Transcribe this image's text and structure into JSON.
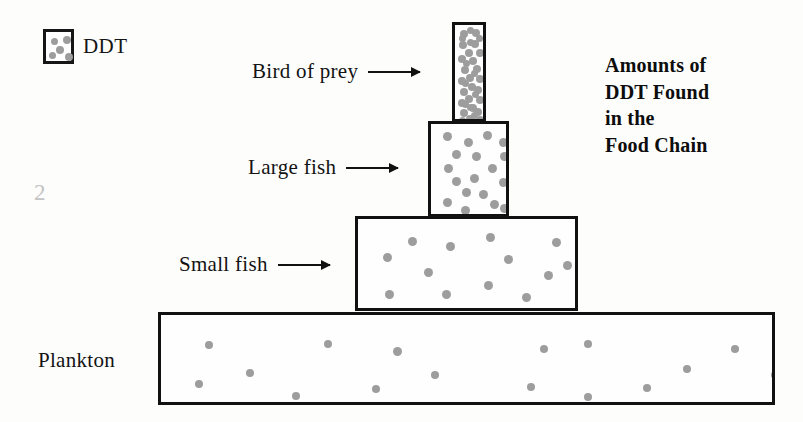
{
  "page": {
    "number": "2",
    "background_color": "#fdfdfc",
    "ink_color": "#111111",
    "dot_color": "#9d9d9d",
    "page_number_color": "#c3c3c3"
  },
  "legend": {
    "swatch_icon": "ddt-dots-swatch",
    "label": "DDT",
    "swatch_dots": [
      {
        "x": 5,
        "y": 6,
        "size": "sm"
      },
      {
        "x": 17,
        "y": 4,
        "size": "md"
      },
      {
        "x": 10,
        "y": 14,
        "size": "md"
      },
      {
        "x": 3,
        "y": 20,
        "size": "sm"
      },
      {
        "x": 19,
        "y": 21,
        "size": "md"
      }
    ]
  },
  "title": {
    "lines": [
      "Amounts of",
      "DDT Found",
      "in the",
      "Food Chain"
    ]
  },
  "chart_data": {
    "type": "bar",
    "xlabel": "",
    "ylabel": "",
    "legend": [
      {
        "name": "DDT",
        "symbol": "dot"
      }
    ],
    "orientation": "stacked-pyramid",
    "categories": [
      "Plankton",
      "Small fish",
      "Large fish",
      "Bird of prey"
    ],
    "values": [
      16,
      13,
      18,
      36
    ],
    "value_meaning": "number of DDT dots drawn inside each level's rectangle",
    "levels": [
      {
        "name": "Bird of prey",
        "label": "Bird of prey",
        "has_arrow": true,
        "rect": {
          "x": 452,
          "y": 22,
          "w": 34,
          "h": 100
        },
        "dot_count": 36,
        "ddt_density": "very high",
        "dots": [
          {
            "x": 5,
            "y": 5,
            "size": "md"
          },
          {
            "x": 17,
            "y": 4,
            "size": "md"
          },
          {
            "x": 4,
            "y": 16,
            "size": "md"
          },
          {
            "x": 16,
            "y": 15,
            "size": "md"
          },
          {
            "x": 10,
            "y": 24,
            "size": "md"
          },
          {
            "x": 21,
            "y": 24,
            "size": "md"
          },
          {
            "x": 3,
            "y": 30,
            "size": "md"
          },
          {
            "x": 14,
            "y": 32,
            "size": "md"
          },
          {
            "x": 6,
            "y": 41,
            "size": "md"
          },
          {
            "x": 18,
            "y": 40,
            "size": "md"
          },
          {
            "x": 11,
            "y": 49,
            "size": "md"
          },
          {
            "x": 21,
            "y": 50,
            "size": "md"
          },
          {
            "x": 3,
            "y": 52,
            "size": "md"
          },
          {
            "x": 13,
            "y": 58,
            "size": "md"
          },
          {
            "x": 5,
            "y": 63,
            "size": "md"
          },
          {
            "x": 19,
            "y": 61,
            "size": "md"
          },
          {
            "x": 10,
            "y": 70,
            "size": "md"
          },
          {
            "x": 21,
            "y": 71,
            "size": "md"
          },
          {
            "x": 3,
            "y": 74,
            "size": "md"
          },
          {
            "x": 14,
            "y": 79,
            "size": "md"
          },
          {
            "x": 5,
            "y": 84,
            "size": "md"
          },
          {
            "x": 19,
            "y": 83,
            "size": "md"
          },
          {
            "x": 11,
            "y": 90,
            "size": "md"
          },
          {
            "x": 21,
            "y": 91,
            "size": "md"
          },
          {
            "x": 4,
            "y": 10,
            "size": "sm"
          },
          {
            "x": 21,
            "y": 10,
            "size": "sm"
          },
          {
            "x": 12,
            "y": 14,
            "size": "sm"
          },
          {
            "x": 8,
            "y": 35,
            "size": "sm"
          },
          {
            "x": 16,
            "y": 45,
            "size": "sm"
          },
          {
            "x": 7,
            "y": 55,
            "size": "sm"
          },
          {
            "x": 17,
            "y": 66,
            "size": "sm"
          },
          {
            "x": 7,
            "y": 76,
            "size": "sm"
          },
          {
            "x": 16,
            "y": 87,
            "size": "sm"
          },
          {
            "x": 4,
            "y": 92,
            "size": "sm"
          },
          {
            "x": 12,
            "y": 79,
            "size": "sm"
          },
          {
            "x": 12,
            "y": 2,
            "size": "sm"
          }
        ]
      },
      {
        "name": "Large fish",
        "label": "Large fish",
        "has_arrow": true,
        "rect": {
          "x": 428,
          "y": 121,
          "w": 81,
          "h": 96
        },
        "dot_count": 18,
        "ddt_density": "high",
        "dots": [
          {
            "x": 12,
            "y": 8,
            "size": "lg"
          },
          {
            "x": 33,
            "y": 14,
            "size": "lg"
          },
          {
            "x": 52,
            "y": 7,
            "size": "lg"
          },
          {
            "x": 68,
            "y": 14,
            "size": "lg"
          },
          {
            "x": 21,
            "y": 26,
            "size": "lg"
          },
          {
            "x": 41,
            "y": 28,
            "size": "lg"
          },
          {
            "x": 69,
            "y": 28,
            "size": "lg"
          },
          {
            "x": 13,
            "y": 40,
            "size": "lg"
          },
          {
            "x": 57,
            "y": 40,
            "size": "lg"
          },
          {
            "x": 21,
            "y": 53,
            "size": "lg"
          },
          {
            "x": 39,
            "y": 50,
            "size": "lg"
          },
          {
            "x": 68,
            "y": 54,
            "size": "lg"
          },
          {
            "x": 31,
            "y": 64,
            "size": "lg"
          },
          {
            "x": 48,
            "y": 66,
            "size": "lg"
          },
          {
            "x": 12,
            "y": 74,
            "size": "lg"
          },
          {
            "x": 59,
            "y": 76,
            "size": "lg"
          },
          {
            "x": 30,
            "y": 82,
            "size": "lg"
          },
          {
            "x": 69,
            "y": 80,
            "size": "lg"
          }
        ]
      },
      {
        "name": "Small fish",
        "label": "Small fish",
        "has_arrow": true,
        "rect": {
          "x": 355,
          "y": 216,
          "w": 223,
          "h": 95
        },
        "dot_count": 13,
        "ddt_density": "moderate",
        "dots": [
          {
            "x": 50,
            "y": 18,
            "size": "lg"
          },
          {
            "x": 88,
            "y": 23,
            "size": "lg"
          },
          {
            "x": 128,
            "y": 14,
            "size": "lg"
          },
          {
            "x": 194,
            "y": 19,
            "size": "lg"
          },
          {
            "x": 25,
            "y": 34,
            "size": "lg"
          },
          {
            "x": 146,
            "y": 36,
            "size": "lg"
          },
          {
            "x": 66,
            "y": 49,
            "size": "lg"
          },
          {
            "x": 186,
            "y": 52,
            "size": "lg"
          },
          {
            "x": 126,
            "y": 62,
            "size": "lg"
          },
          {
            "x": 27,
            "y": 71,
            "size": "lg"
          },
          {
            "x": 84,
            "y": 71,
            "size": "lg"
          },
          {
            "x": 164,
            "y": 74,
            "size": "lg"
          },
          {
            "x": 205,
            "y": 42,
            "size": "lg"
          }
        ]
      },
      {
        "name": "Plankton",
        "label": "Plankton",
        "has_arrow": false,
        "rect": {
          "x": 158,
          "y": 312,
          "w": 617,
          "h": 93
        },
        "dot_count": 16,
        "ddt_density": "low",
        "dots": [
          {
            "x": 44,
            "y": 26,
            "size": "md"
          },
          {
            "x": 163,
            "y": 25,
            "size": "md"
          },
          {
            "x": 232,
            "y": 32,
            "size": "lg"
          },
          {
            "x": 379,
            "y": 30,
            "size": "md"
          },
          {
            "x": 423,
            "y": 25,
            "size": "md"
          },
          {
            "x": 85,
            "y": 54,
            "size": "md"
          },
          {
            "x": 34,
            "y": 65,
            "size": "md"
          },
          {
            "x": 270,
            "y": 56,
            "size": "md"
          },
          {
            "x": 366,
            "y": 68,
            "size": "md"
          },
          {
            "x": 522,
            "y": 50,
            "size": "md"
          },
          {
            "x": 131,
            "y": 77,
            "size": "md"
          },
          {
            "x": 211,
            "y": 70,
            "size": "md"
          },
          {
            "x": 423,
            "y": 78,
            "size": "md"
          },
          {
            "x": 570,
            "y": 30,
            "size": "md"
          },
          {
            "x": 482,
            "y": 69,
            "size": "md"
          },
          {
            "x": 610,
            "y": 56,
            "size": "md"
          }
        ]
      }
    ]
  }
}
